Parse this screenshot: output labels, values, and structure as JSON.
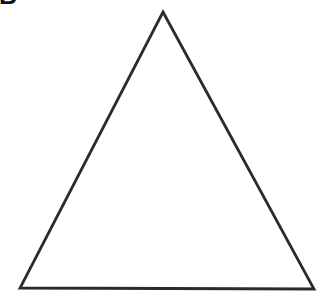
{
  "figure": {
    "panel_label": "B",
    "panel_label_clipped": true,
    "background_color": "#ffffff",
    "width": 329,
    "height": 302,
    "shape": {
      "name": "triangle",
      "type": "polygon",
      "fill": "none",
      "fill_color": "#ffffff",
      "stroke_color": "#2b2b2b",
      "stroke_width": 2.8,
      "vertices": [
        {
          "name": "apex",
          "x": 163,
          "y": 12
        },
        {
          "name": "bottom-right",
          "x": 314,
          "y": 289
        },
        {
          "name": "bottom-left",
          "x": 20,
          "y": 288
        }
      ],
      "points_attr": "163,12 314,289 20,288"
    }
  }
}
